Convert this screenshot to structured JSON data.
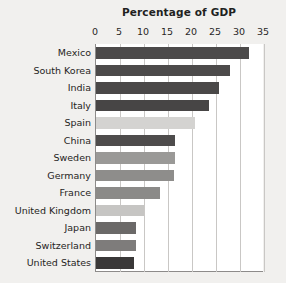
{
  "chart_data": {
    "type": "bar",
    "orientation": "horizontal",
    "title": "Percentage of GDP",
    "xlabel": "",
    "ylabel": "",
    "xlim": [
      0,
      35
    ],
    "xticks": [
      0,
      5,
      10,
      15,
      20,
      25,
      30,
      35
    ],
    "xtick_labels": [
      "0",
      "5",
      "10",
      "15",
      "20",
      "25",
      "30",
      "35"
    ],
    "grid": "vertical",
    "legend": "none",
    "categories": [
      "Mexico",
      "South Korea",
      "India",
      "Italy",
      "Spain",
      "China",
      "Sweden",
      "Germany",
      "France",
      "United Kingdom",
      "Japan",
      "Switzerland",
      "United States"
    ],
    "values": [
      31.9,
      28.0,
      25.7,
      23.6,
      20.7,
      16.5,
      16.4,
      16.3,
      13.3,
      10.0,
      8.3,
      8.4,
      8.0
    ],
    "bar_colors": [
      "#4c4a4a",
      "#4c4a4a",
      "#4a4848",
      "#474545",
      "#d4d3d1",
      "#4e4c4c",
      "#9a9997",
      "#8e8d8b",
      "#8b8a88",
      "#c6c5c3",
      "#6b6968",
      "#7e7c7b",
      "#3a3838"
    ]
  },
  "colors": {
    "background": "#f1f0ee",
    "plot_background": "#ffffff",
    "gridline": "#c9c7c5",
    "axis": "#8d8b8a",
    "text": "#262423"
  }
}
